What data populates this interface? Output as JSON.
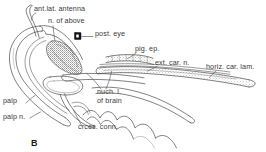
{
  "figure": {
    "panel_letter": "B",
    "background_color": "#ffffff",
    "ink_color": "#3a3a3a",
    "label_color": "#3a3a3a",
    "width": 266,
    "height": 152,
    "caption_note": "",
    "labels": [
      {
        "id": "ant-lat-antenna",
        "text": "ant.lat. antenna",
        "x": 34,
        "y": 9
      },
      {
        "id": "n-of-above",
        "text": "n. of above",
        "x": 48,
        "y": 21
      },
      {
        "id": "post-eye",
        "text": "post. eye",
        "x": 95,
        "y": 34
      },
      {
        "id": "pig-ep",
        "text": "pig. ep.",
        "x": 135,
        "y": 49
      },
      {
        "id": "ext-car-n",
        "text": "ext. car. n.",
        "x": 155,
        "y": 63
      },
      {
        "id": "horiz-car-lam",
        "text": "horiz. car. lam.",
        "x": 206,
        "y": 67
      },
      {
        "id": "nuch-l-of-brain-1",
        "text": "nuch. l.",
        "x": 97,
        "y": 92
      },
      {
        "id": "nuch-l-of-brain-2",
        "text": "of brain",
        "x": 97,
        "y": 101
      },
      {
        "id": "palp",
        "text": "palp",
        "x": 3,
        "y": 101
      },
      {
        "id": "palp-n",
        "text": "palp n.",
        "x": 3,
        "y": 117
      },
      {
        "id": "crces-conn",
        "text": "crces. conn.",
        "x": 78,
        "y": 127
      }
    ]
  }
}
